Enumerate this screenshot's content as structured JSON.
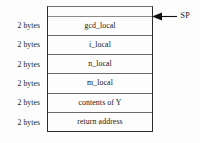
{
  "diagram": {
    "type": "memory-layout",
    "box": {
      "has_empty_top_strip": true
    },
    "size_labels": [
      {
        "text": "2 bytes"
      },
      {
        "text": "2 bytes"
      },
      {
        "text": "2 bytes"
      },
      {
        "text": "2 bytes"
      },
      {
        "text": "2 bytes"
      },
      {
        "text": "2 bytes"
      }
    ],
    "slots": [
      {
        "label": "gcd_local"
      },
      {
        "label": "i_local"
      },
      {
        "label": "n_local"
      },
      {
        "label": "m_local"
      },
      {
        "label": "contents of Y"
      },
      {
        "label": "return address"
      }
    ],
    "annotations": [
      {
        "icon": "left-arrow-icon",
        "label": "SP",
        "points_to_slot": "gcd_local"
      }
    ],
    "colors": {
      "background": "#fdfdfd",
      "box_border": "#2b2b2b",
      "separator": "#6a6a6a",
      "text": "#111111",
      "arrow": "#111111"
    }
  }
}
